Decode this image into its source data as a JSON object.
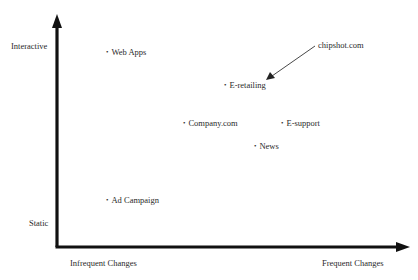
{
  "diagram": {
    "type": "positioning-quadrant",
    "y_axis": {
      "top_label": "Interactive",
      "bottom_label": "Static"
    },
    "x_axis": {
      "left_label": "Infrequent Changes",
      "right_label": "Frequent Changes"
    },
    "points": [
      {
        "label": "Web Apps",
        "bullet": "•"
      },
      {
        "label": "E-retailing",
        "bullet": "•"
      },
      {
        "label": "Company.com",
        "bullet": "•"
      },
      {
        "label": "E-support",
        "bullet": "•"
      },
      {
        "label": "News",
        "bullet": "•"
      },
      {
        "label": "Ad Campaign",
        "bullet": "•"
      }
    ],
    "callout": {
      "label": "chipshot.com",
      "points_to": "E-retailing"
    },
    "colors": {
      "axis": "#111111",
      "text": "#2a2a2a",
      "background": "#ffffff"
    }
  }
}
